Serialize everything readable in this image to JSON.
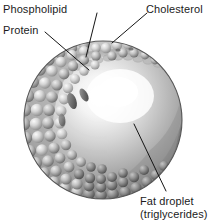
{
  "figure": {
    "background_color": "#ffffff",
    "text_color": "#1b1b1b",
    "width": 216,
    "height": 223,
    "style": "grayscale scientific illustration"
  },
  "labels": {
    "phospholipid": "Phospholipid",
    "protein": "Protein",
    "cholesterol": "Cholesterol",
    "fat_droplet_line1": "Fat droplet",
    "fat_droplet_line2": "(triglycerides)"
  },
  "colors": {
    "outline": "#111111",
    "leader_line": "#111111",
    "bead_light": "#d8d8d8",
    "bead_mid": "#a8a8a8",
    "bead_dark": "#6f6f6f",
    "bead_shadow": "#4a4a4a",
    "droplet_highlight": "#ffffff",
    "droplet_mid": "#c9c9c9",
    "droplet_dark": "#8a8a8a",
    "sphere_edge": "#5e5e5e"
  },
  "structures": {
    "outer_shell": "phospholipid bead monolayer",
    "inner_core": "fat droplet (triglycerides)",
    "embedded_items": [
      "protein",
      "cholesterol"
    ]
  }
}
